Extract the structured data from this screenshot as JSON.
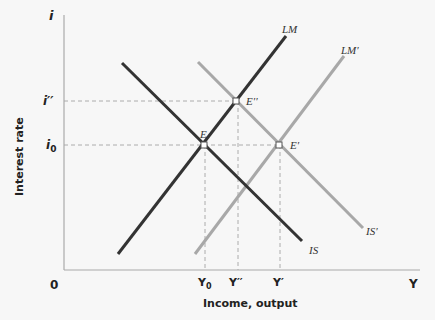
{
  "diagram": {
    "axes": {
      "y_axis_symbol": "i",
      "x_axis_symbol": "Y",
      "origin": "0",
      "y_label": "Interest rate",
      "x_label": "Income, output"
    },
    "y_ticks": [
      {
        "label": "i''",
        "display": "i′′",
        "y": 101
      },
      {
        "label": "i0",
        "display_main": "i",
        "display_sub": "0",
        "y": 145
      }
    ],
    "x_ticks": [
      {
        "label": "Y0",
        "display_main": "Y",
        "display_sub": "0",
        "x": 205
      },
      {
        "label": "Y''",
        "display": "Y′′",
        "x": 238
      },
      {
        "label": "Y'",
        "display": "Y′",
        "x": 280
      }
    ],
    "curves": [
      {
        "name": "LM",
        "label": "LM",
        "color": "#333333",
        "x1": 118,
        "y1": 254,
        "x2": 286,
        "y2": 36
      },
      {
        "name": "IS",
        "label": "IS",
        "color": "#333333",
        "x1": 122,
        "y1": 63,
        "x2": 302,
        "y2": 241
      },
      {
        "name": "LM'",
        "label": "LM′",
        "color": "#a8a8a8",
        "x1": 195,
        "y1": 254,
        "x2": 344,
        "y2": 56
      },
      {
        "name": "IS'",
        "label": "IS′",
        "color": "#a8a8a8",
        "x1": 198,
        "y1": 62,
        "x2": 363,
        "y2": 228
      }
    ],
    "equilibria": [
      {
        "name": "E",
        "label": "E",
        "x": 204,
        "y": 145
      },
      {
        "name": "E''",
        "label": "E′′",
        "x": 236,
        "y": 101
      },
      {
        "name": "E'",
        "label": "E′",
        "x": 279,
        "y": 145
      }
    ]
  }
}
